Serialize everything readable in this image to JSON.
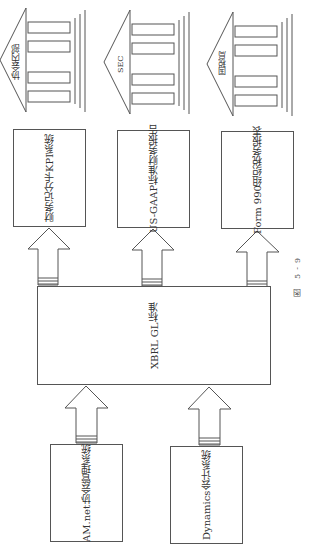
{
  "figure": {
    "caption": "图 5-9",
    "orientation": "rotated-90-cw"
  },
  "institutions": [
    {
      "label": "协会内部"
    },
    {
      "label": "SEC"
    },
    {
      "label": "国税局"
    }
  ],
  "reports": [
    {
      "line1": "财务记分卡",
      "line2": "KPI系统"
    },
    {
      "line1": "US-GAAP",
      "line2": "标准财务报告"
    },
    {
      "line1": "Form 990",
      "line2": "组织税务报表"
    }
  ],
  "hub": {
    "line1": "XBRL GL",
    "line2": "标准"
  },
  "sources": [
    {
      "line1": "AM.net",
      "line2": "协会管理系统"
    },
    {
      "line1": "Dynamics",
      "line2": "会计系统"
    }
  ],
  "colors": {
    "stroke": "#555555",
    "fill": "#ffffff",
    "text": "#333333"
  }
}
